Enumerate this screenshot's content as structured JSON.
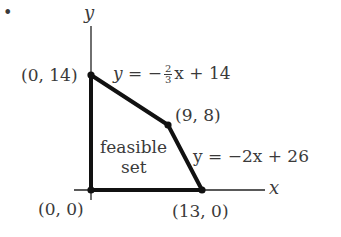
{
  "bullet": "•",
  "axes": {
    "x_label": "x",
    "y_label": "y"
  },
  "vertices": [
    {
      "label": "(0, 14)",
      "x": 0,
      "y": 14
    },
    {
      "label": "(9, 8)",
      "x": 9,
      "y": 8
    },
    {
      "label": "(13, 0)",
      "x": 13,
      "y": 0
    },
    {
      "label": "(0, 0)",
      "x": 0,
      "y": 0
    }
  ],
  "lines": {
    "upper": {
      "lhs": "y",
      "eq": "=",
      "sign": "−",
      "num": "2",
      "den": "3",
      "rest": "x + 14"
    },
    "lower": {
      "text": "y = −2x + 26"
    }
  },
  "region_label": {
    "line1": "feasible",
    "line2": "set"
  },
  "colors": {
    "stroke": "#111111",
    "axis": "#222222",
    "text": "#3a3a3a"
  }
}
